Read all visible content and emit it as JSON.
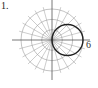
{
  "problem_number": "1.",
  "chart_data": {
    "type": "polar",
    "title": "",
    "equation_description": "circle through pole, diameter 6 along polar axis (r = 6cos θ)",
    "grid": {
      "radial_circles": [
        2,
        4,
        6
      ],
      "angle_step_degrees": 15
    },
    "annotations": [
      {
        "text": "6",
        "r": 6,
        "theta_degrees": 0
      }
    ],
    "series": [
      {
        "name": "curve",
        "r_max": 6,
        "center": [
          3,
          0
        ],
        "radius": 3
      }
    ]
  },
  "labels": {
    "axis_tick": "6"
  }
}
